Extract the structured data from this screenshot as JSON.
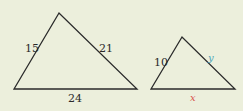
{
  "diagram": {
    "background": "#ecefdc",
    "large_triangle": {
      "side_left": "15",
      "side_right": "21",
      "side_bottom": "24"
    },
    "small_triangle": {
      "side_left": "10",
      "side_right": "y",
      "side_bottom": "x",
      "y_color": "#4aa3b8",
      "x_color": "#d9534f"
    }
  }
}
